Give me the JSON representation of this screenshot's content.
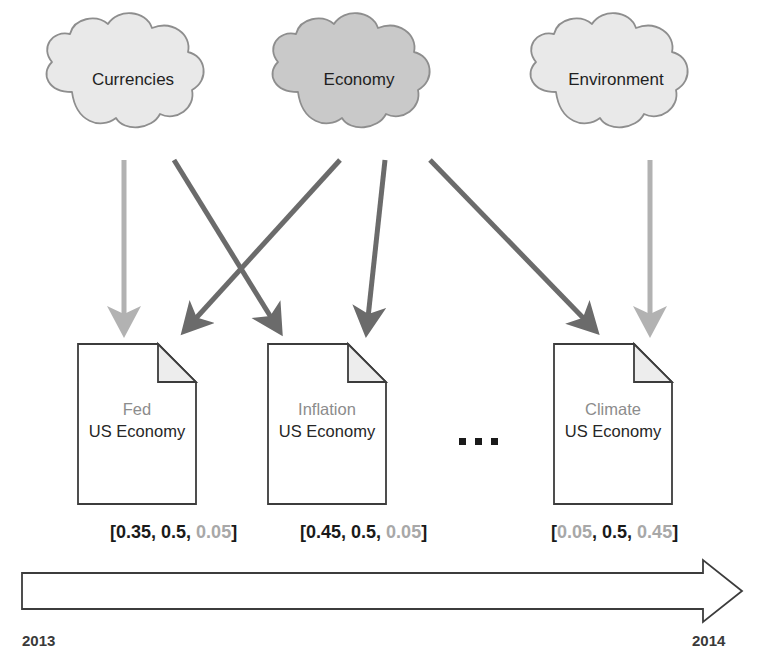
{
  "diagram": {
    "colors": {
      "cloud_light_fill": "#e9e9e9",
      "cloud_dark_fill": "#c9c9c9",
      "cloud_stroke": "#8e8e8e",
      "arrow_dark": "#6b6b6b",
      "arrow_light": "#b2b2b2",
      "doc_stroke": "#3c3c3c",
      "doc_fold_fill": "#ededed",
      "text_dark": "#1a1a1a",
      "text_gray": "#8c8c8c",
      "timeline_stroke": "#3c3c3c"
    },
    "topics": [
      {
        "id": "currencies",
        "label": "Currencies",
        "shade": "light"
      },
      {
        "id": "economy",
        "label": "Economy",
        "shade": "dark"
      },
      {
        "id": "environment",
        "label": "Environment",
        "shade": "light"
      }
    ],
    "documents": [
      {
        "id": "fed",
        "topic_label": "Fed",
        "body_label": "US Economy",
        "vector": {
          "text": "[0.35, 0.5, 0.05]",
          "values": [
            0.35,
            0.5,
            0.05
          ],
          "emphasis": [
            "dark",
            "dark",
            "light"
          ]
        }
      },
      {
        "id": "inflation",
        "topic_label": "Inflation",
        "body_label": "US Economy",
        "vector": {
          "text": "[0.45, 0.5, 0.05]",
          "values": [
            0.45,
            0.5,
            0.05
          ],
          "emphasis": [
            "dark",
            "dark",
            "light"
          ]
        }
      },
      {
        "id": "climate",
        "topic_label": "Climate",
        "body_label": "US Economy",
        "vector": {
          "text": "[0.05, 0.5, 0.45]",
          "values": [
            0.05,
            0.5,
            0.45
          ],
          "emphasis": [
            "light",
            "dark",
            "light"
          ]
        }
      }
    ],
    "ellipsis": "...",
    "edges": [
      {
        "from": "currencies",
        "to": "fed",
        "weight": "light"
      },
      {
        "from": "currencies",
        "to": "inflation",
        "weight": "dark"
      },
      {
        "from": "economy",
        "to": "fed",
        "weight": "dark"
      },
      {
        "from": "economy",
        "to": "inflation",
        "weight": "dark"
      },
      {
        "from": "economy",
        "to": "climate",
        "weight": "dark"
      },
      {
        "from": "environment",
        "to": "climate",
        "weight": "light"
      }
    ],
    "timeline": {
      "start_label": "2013",
      "end_label": "2014"
    }
  }
}
